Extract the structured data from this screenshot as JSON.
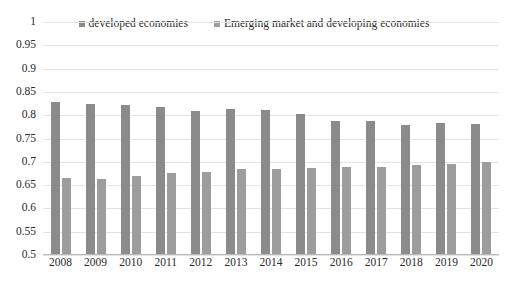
{
  "chart_data": {
    "type": "bar",
    "title": "",
    "subtitle": "",
    "xlabel": "",
    "ylabel": "",
    "ylim": [
      0.5,
      1
    ],
    "ytick_step": 0.05,
    "yticks": [
      "1",
      "0.95",
      "0.9",
      "0.85",
      "0.8",
      "0.75",
      "0.7",
      "0.65",
      "0.6",
      "0.55",
      "0.5"
    ],
    "ytick_values": [
      1,
      0.95,
      0.9,
      0.85,
      0.8,
      0.75,
      0.7,
      0.65,
      0.6,
      0.55,
      0.5
    ],
    "grid": true,
    "legend_position": "top-center",
    "categories": [
      "2008",
      "2009",
      "2010",
      "2011",
      "2012",
      "2013",
      "2014",
      "2015",
      "2016",
      "2017",
      "2018",
      "2019",
      "2020"
    ],
    "series": [
      {
        "name": "developed economies",
        "color": "#8b8b8b",
        "values": [
          0.829,
          0.823,
          0.822,
          0.818,
          0.808,
          0.813,
          0.812,
          0.803,
          0.787,
          0.788,
          0.779,
          0.783,
          0.781
        ]
      },
      {
        "name": "Emerging market and developing economies",
        "color": "#9d9d9d",
        "values": [
          0.665,
          0.663,
          0.669,
          0.677,
          0.679,
          0.685,
          0.685,
          0.686,
          0.688,
          0.688,
          0.694,
          0.695,
          0.699
        ]
      }
    ]
  },
  "legend": {
    "items": [
      {
        "label": "developed economies",
        "color": "#8b8b8b"
      },
      {
        "label": "Emerging market and developing economies",
        "color": "#9d9d9d"
      }
    ]
  }
}
